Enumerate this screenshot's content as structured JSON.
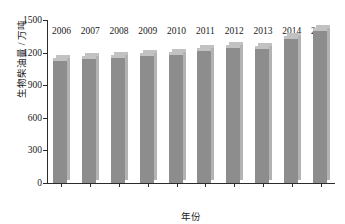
{
  "chart_data": {
    "type": "bar",
    "title": "",
    "xlabel": "年份",
    "ylabel": "生物柴油量 / 万吨",
    "categories": [
      "2006",
      "2007",
      "2008",
      "2009",
      "2010",
      "2011",
      "2012",
      "2013",
      "2014",
      "2015"
    ],
    "values": [
      1150,
      1165,
      1180,
      1200,
      1205,
      1245,
      1270,
      1265,
      1350,
      1425
    ],
    "series": [
      {
        "name": "生物柴油量",
        "values": [
          1150,
          1165,
          1180,
          1200,
          1205,
          1245,
          1270,
          1265,
          1350,
          1425
        ]
      }
    ],
    "ylim": [
      0,
      1500
    ],
    "yticks": [
      "0",
      "300",
      "600",
      "900",
      "1200",
      "1500"
    ],
    "ytick_values": [
      0,
      300,
      600,
      900,
      1200,
      1500
    ],
    "xticks": [
      "2006",
      "2007",
      "2008",
      "2009",
      "2010",
      "2011",
      "2012",
      "2013",
      "2014",
      "2015"
    ],
    "grid": false,
    "legend": false,
    "legend_position": "none",
    "bar_color": "#8d8d8d",
    "bar_highlight_color": "#c2c2c2",
    "bar_side_color": "#b3b3b3",
    "axis_color": "#2b2b2b",
    "background_color": "#ffffff",
    "style": "3d-bar"
  }
}
